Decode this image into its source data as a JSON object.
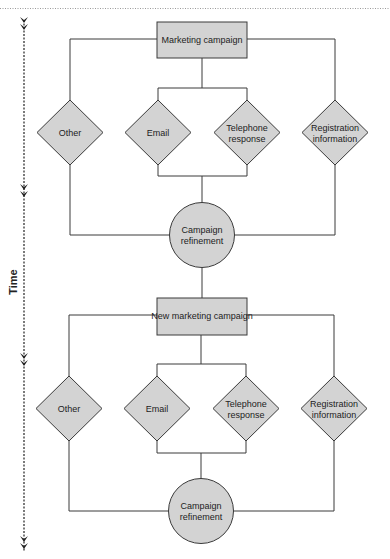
{
  "diagram": {
    "time_axis": {
      "label": "Time",
      "arrow_markers_y": [
        24,
        191,
        360,
        543
      ]
    },
    "colors": {
      "node_fill": "#d3d3d3",
      "stroke": "#3a3a3a",
      "dotted_rule": "#9a9a9a"
    },
    "cycles": [
      {
        "campaign": {
          "label": "Marketing campaign"
        },
        "decisions": [
          {
            "id": "other",
            "lines": [
              "Other"
            ]
          },
          {
            "id": "email",
            "lines": [
              "Email"
            ]
          },
          {
            "id": "telephone",
            "lines": [
              "Telephone",
              "response"
            ]
          },
          {
            "id": "registration",
            "lines": [
              "Registration",
              "information"
            ]
          }
        ],
        "refinement": {
          "lines": [
            "Campaign",
            "refinement"
          ]
        }
      },
      {
        "campaign": {
          "label": "New marketing campaign"
        },
        "decisions": [
          {
            "id": "other",
            "lines": [
              "Other"
            ]
          },
          {
            "id": "email",
            "lines": [
              "Email"
            ]
          },
          {
            "id": "telephone",
            "lines": [
              "Telephone",
              "response"
            ]
          },
          {
            "id": "registration",
            "lines": [
              "Registration",
              "information"
            ]
          }
        ],
        "refinement": {
          "lines": [
            "Campaign",
            "refinement"
          ]
        }
      }
    ]
  }
}
